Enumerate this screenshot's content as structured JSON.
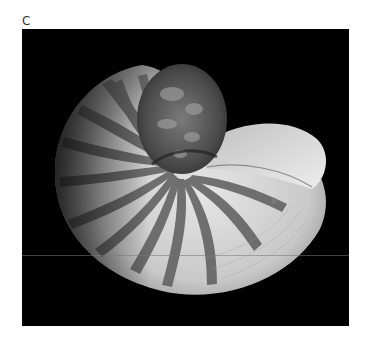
{
  "figure": {
    "panel_label": "C",
    "background_color": "#000000",
    "subject_description": "Chambered nautilus shell photographed on black background, with dark tiger-stripe bands radiating across a pale shell body and a textured, mottled coil at the top"
  },
  "colors": {
    "shell_light": "#d9d9d9",
    "shell_mid": "#a8a8a8",
    "stripe_dark": "#5a5a5a",
    "background": "#000000"
  }
}
